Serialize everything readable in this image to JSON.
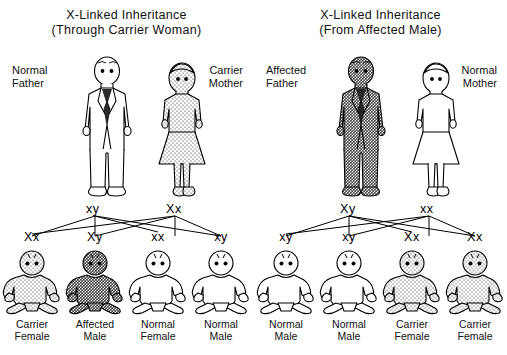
{
  "document": {
    "kind": "x-linked-inheritance-diagram",
    "background_color": "#ffffff",
    "ink_color": "#000000"
  },
  "shading": {
    "unaffected_color": "#ffffff",
    "carrier_color": "#d8d8d8",
    "affected_color": "#8a8a8a"
  },
  "panels": [
    {
      "id": "through-carrier-woman",
      "title_line1": "X-Linked Inheritance",
      "title_line2": "(Through Carrier Woman)",
      "father": {
        "label_line1": "Normal",
        "label_line2": "Father",
        "genotype": "xy",
        "status": "unaffected"
      },
      "mother": {
        "label_line1": "Carrier",
        "label_line2": "Mother",
        "genotype": "Xx",
        "status": "carrier"
      },
      "children": [
        {
          "genotype": "Xx",
          "caption_line1": "Carrier",
          "caption_line2": "Female",
          "status": "carrier"
        },
        {
          "genotype": "Xy",
          "caption_line1": "Affected",
          "caption_line2": "Male",
          "status": "affected"
        },
        {
          "genotype": "xx",
          "caption_line1": "Normal",
          "caption_line2": "Female",
          "status": "unaffected"
        },
        {
          "genotype": "xy",
          "caption_line1": "Normal",
          "caption_line2": "Male",
          "status": "unaffected"
        }
      ]
    },
    {
      "id": "from-affected-male",
      "title_line1": "X-Linked Inheritance",
      "title_line2": "(From Affected Male)",
      "father": {
        "label_line1": "Affected",
        "label_line2": "Father",
        "genotype": "Xy",
        "status": "affected"
      },
      "mother": {
        "label_line1": "Normal",
        "label_line2": "Mother",
        "genotype": "xx",
        "status": "unaffected"
      },
      "children": [
        {
          "genotype": "xy",
          "caption_line1": "Normal",
          "caption_line2": "Male",
          "status": "unaffected"
        },
        {
          "genotype": "xy",
          "caption_line1": "Normal",
          "caption_line2": "Male",
          "status": "unaffected"
        },
        {
          "genotype": "Xx",
          "caption_line1": "Carrier",
          "caption_line2": "Female",
          "status": "carrier"
        },
        {
          "genotype": "Xx",
          "caption_line1": "Carrier",
          "caption_line2": "Female",
          "status": "carrier"
        }
      ]
    }
  ]
}
